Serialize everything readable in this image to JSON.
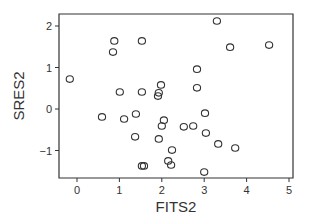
{
  "chart_data": {
    "type": "scatter",
    "title": "",
    "xlabel": "FITS2",
    "ylabel": "SRES2",
    "xlim": [
      -0.4,
      5.1
    ],
    "ylim": [
      -1.68,
      2.3
    ],
    "xticks": [
      0,
      1,
      2,
      3,
      4,
      5
    ],
    "yticks": [
      -1,
      0,
      1,
      2
    ],
    "xtick_labels": [
      "0",
      "1",
      "2",
      "3",
      "4",
      "5"
    ],
    "ytick_labels": [
      "−1",
      "0",
      "1",
      "2"
    ],
    "grid": false,
    "legend": null,
    "marker": "open-circle",
    "points": [
      {
        "x": -0.17,
        "y": 0.72
      },
      {
        "x": 0.85,
        "y": 1.37
      },
      {
        "x": 0.88,
        "y": 1.64
      },
      {
        "x": 1.53,
        "y": 1.64
      },
      {
        "x": 1.01,
        "y": 0.41
      },
      {
        "x": 1.53,
        "y": 0.41
      },
      {
        "x": 1.98,
        "y": 0.58
      },
      {
        "x": 1.93,
        "y": 0.39
      },
      {
        "x": 1.91,
        "y": 0.31
      },
      {
        "x": 3.3,
        "y": 2.12
      },
      {
        "x": 3.61,
        "y": 1.49
      },
      {
        "x": 4.53,
        "y": 1.54
      },
      {
        "x": 2.83,
        "y": 0.96
      },
      {
        "x": 2.83,
        "y": 0.51
      },
      {
        "x": 0.59,
        "y": -0.19
      },
      {
        "x": 1.11,
        "y": -0.24
      },
      {
        "x": 1.39,
        "y": -0.12
      },
      {
        "x": 2.05,
        "y": -0.27
      },
      {
        "x": 2.0,
        "y": -0.41
      },
      {
        "x": 1.37,
        "y": -0.67
      },
      {
        "x": 1.93,
        "y": -0.72
      },
      {
        "x": 2.24,
        "y": -0.99
      },
      {
        "x": 1.53,
        "y": -1.37
      },
      {
        "x": 1.58,
        "y": -1.37
      },
      {
        "x": 2.15,
        "y": -1.25
      },
      {
        "x": 2.22,
        "y": -1.35
      },
      {
        "x": 2.52,
        "y": -0.43
      },
      {
        "x": 2.74,
        "y": -0.41
      },
      {
        "x": 3.02,
        "y": -0.1
      },
      {
        "x": 3.04,
        "y": -0.58
      },
      {
        "x": 3.33,
        "y": -0.84
      },
      {
        "x": 3.73,
        "y": -0.94
      },
      {
        "x": 3.0,
        "y": -1.52
      }
    ]
  },
  "layout": {
    "plot_left_px": 59,
    "plot_right_px": 293,
    "plot_top_px": 14,
    "plot_bottom_px": 178,
    "x0_px": 77,
    "x_px_per_unit": 42.4,
    "y0_px": 109,
    "y_px_per_unit": 41.5
  },
  "colors": {
    "axis": "#333333",
    "marker_stroke": "#333333",
    "background": "#ffffff"
  }
}
